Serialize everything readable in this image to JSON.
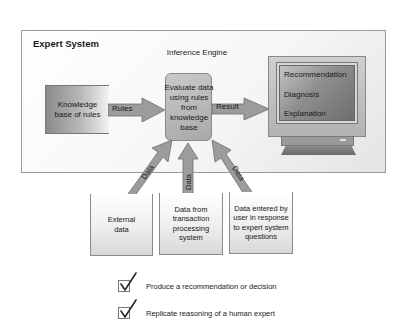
{
  "diagram": {
    "container_title": "Expert System",
    "knowledge_base": "Knowledge base of rules",
    "inference_engine": {
      "label": "Inference Engine",
      "description": "Evaluate data using rules from knowledge base"
    },
    "arrows": {
      "rules": "Rules",
      "result": "Result",
      "data_left": "Data",
      "data_center": "Data",
      "data_right": "Data"
    },
    "monitor": {
      "items": [
        "Recommendation",
        "Diagnosis",
        "Explanation"
      ]
    },
    "sources": [
      {
        "label": "External data"
      },
      {
        "label": "Data from transaction processing system"
      },
      {
        "label": "Data entered by user in response to expert system questions"
      }
    ],
    "goals": [
      {
        "text": "Produce a recommendation or decision",
        "checked": true
      },
      {
        "text": "Replicate reasoning of a human expert",
        "checked": true
      }
    ],
    "colors": {
      "arrow_fill": "#9c9c9c",
      "arrow_stroke": "#6f6f6f",
      "check_color": "#2a2a2a"
    }
  }
}
